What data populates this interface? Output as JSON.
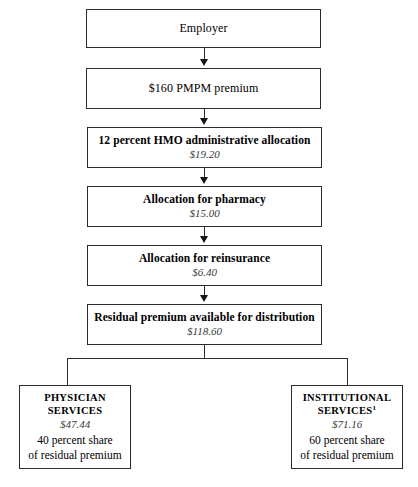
{
  "diagram": {
    "type": "flowchart",
    "orientation": "top-down-with-split",
    "chain": [
      {
        "title": "Employer",
        "amount": ""
      },
      {
        "title": "$160 PMPM premium",
        "amount": ""
      },
      {
        "title": "12 percent HMO administrative allocation",
        "amount": "$19.20"
      },
      {
        "title": "Allocation for pharmacy",
        "amount": "$15.00"
      },
      {
        "title": "Allocation for reinsurance",
        "amount": "$6.40"
      },
      {
        "title": "Residual premium available for distribution",
        "amount": "$118.60"
      }
    ],
    "branches": [
      {
        "name_line1": "PHYSICIAN",
        "name_line2": "SERVICES",
        "footnote_marker": "",
        "amount": "$47.44",
        "share_line1": "40 percent share",
        "share_line2": "of residual premium"
      },
      {
        "name_line1": "INSTITUTIONAL",
        "name_line2": "SERVICES",
        "footnote_marker": "1",
        "amount": "$71.16",
        "share_line1": "60 percent share",
        "share_line2": "of residual premium"
      }
    ],
    "colors": {
      "border": "#2b2b2b",
      "background": "#ffffff",
      "text": "#000000",
      "amount_text": "#3a3a3a",
      "arrow": "#151515"
    }
  }
}
